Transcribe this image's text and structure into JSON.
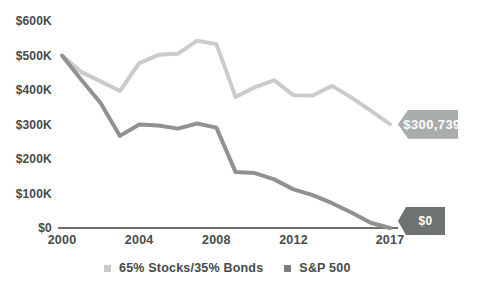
{
  "chart": {
    "y_axis": {
      "tick_labels": [
        "$600K",
        "$500K",
        "$400K",
        "$300K",
        "$200K",
        "$100K",
        "$0"
      ],
      "tick_values_k": [
        600,
        500,
        400,
        300,
        200,
        100,
        0
      ]
    },
    "x_axis": {
      "tick_labels": [
        "2000",
        "2004",
        "2008",
        "2012",
        "2017"
      ],
      "tick_values": [
        2000,
        2004,
        2008,
        2012,
        2017
      ]
    },
    "end_labels": [
      {
        "series": "65% Stocks/35% Bonds",
        "text": "$300,739",
        "bg_color": "#a8acaa",
        "text_color": "#ffffff"
      },
      {
        "series": "S&P 500",
        "text": "$0",
        "bg_color": "#6c7371",
        "text_color": "#ffffff"
      }
    ],
    "legend": [
      {
        "label": "65% Stocks/35% Bonds",
        "color": "#c7cac7"
      },
      {
        "label": "S&P 500",
        "color": "#7b807e"
      }
    ],
    "axis_color": "#3d3f3e"
  },
  "chart_data": {
    "type": "line",
    "title": "",
    "xlabel": "",
    "ylabel": "",
    "x": [
      2000,
      2001,
      2002,
      2003,
      2004,
      2005,
      2006,
      2007,
      2008,
      2009,
      2010,
      2011,
      2012,
      2013,
      2014,
      2015,
      2016,
      2017
    ],
    "series": [
      {
        "name": "65% Stocks/35% Bonds",
        "color": "#c9ccc9",
        "values_k": [
          500,
          452,
          425,
          397,
          478,
          502,
          505,
          543,
          533,
          380,
          408,
          428,
          385,
          384,
          412,
          378,
          340,
          300.739
        ],
        "final_value_label": "$300,739"
      },
      {
        "name": "S&P 500",
        "color": "#8e9290",
        "values_k": [
          500,
          430,
          362,
          267,
          300,
          297,
          288,
          303,
          291,
          162,
          159,
          141,
          112,
          95,
          72,
          45,
          15,
          0
        ],
        "final_value_label": "$0"
      }
    ],
    "ylim_k": [
      0,
      600
    ],
    "xlim": [
      2000,
      2017
    ],
    "grid": false,
    "legend_position": "bottom"
  }
}
